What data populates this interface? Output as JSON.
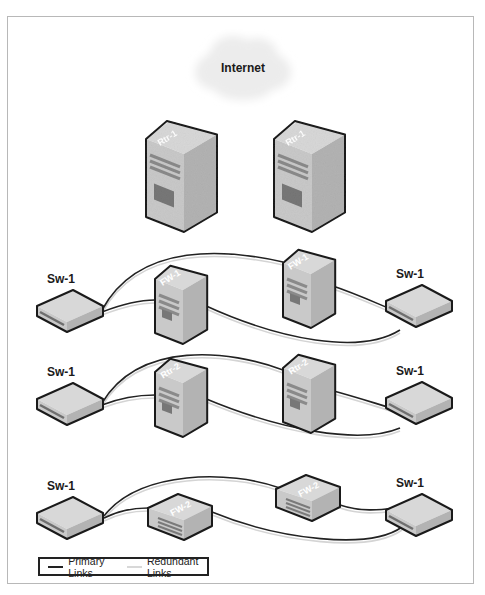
{
  "cloud": {
    "label": "Internet",
    "cx": 243,
    "cy": 68
  },
  "colors": {
    "primary": "#222222",
    "redundant": "#d4d4d4",
    "device_face": "#c9c9c9",
    "device_side": "#b3b3b3",
    "device_top": "#d8d8d8",
    "outline": "#1a1a1a",
    "cloud": "#ececec",
    "frame": "#b8b8b8"
  },
  "routers_top": [
    {
      "label": "Rtr-1",
      "x": 146,
      "y": 124
    },
    {
      "label": "Rtr-1",
      "x": 274,
      "y": 124
    }
  ],
  "rows": [
    {
      "name": "firewall-tier-1",
      "left_switch": {
        "label": "Sw-1",
        "x": 37,
        "y": 290
      },
      "right_switch": {
        "label": "Sw-1",
        "x": 386,
        "y": 285
      },
      "left_device": {
        "label": "FW-1",
        "kind": "tower-small",
        "x": 155,
        "y": 268
      },
      "right_device": {
        "label": "FW-1",
        "kind": "tower-small",
        "x": 283,
        "y": 252
      },
      "primary_links": [
        "M102,310 C140,240 230,250 283,262",
        "M102,312 C120,305 140,300 155,300",
        "M204,305 C280,340 360,355 400,330",
        "M330,285 C360,295 380,305 398,312"
      ]
    },
    {
      "name": "router-tier-2",
      "left_switch": {
        "label": "Sw-1",
        "x": 37,
        "y": 383
      },
      "right_switch": {
        "label": "Sw-1",
        "x": 386,
        "y": 382
      },
      "left_device": {
        "label": "Rtr-2",
        "kind": "tower-small",
        "x": 155,
        "y": 361
      },
      "right_device": {
        "label": "Rtr-2",
        "kind": "tower-small",
        "x": 283,
        "y": 357
      },
      "primary_links": [
        "M102,403 C140,340 230,350 283,370",
        "M102,405 C120,398 140,395 155,395",
        "M204,398 C280,430 360,445 400,428",
        "M330,390 C360,398 380,405 398,410"
      ]
    },
    {
      "name": "firewall-tier-2",
      "left_switch": {
        "label": "Sw-1",
        "x": 37,
        "y": 497
      },
      "right_switch": {
        "label": "Sw-1",
        "x": 386,
        "y": 494
      },
      "left_device": {
        "label": "FW-2",
        "kind": "box",
        "x": 148,
        "y": 494
      },
      "right_device": {
        "label": "FW-2",
        "kind": "box",
        "x": 276,
        "y": 475
      },
      "primary_links": [
        "M104,516 C140,470 230,470 280,488",
        "M104,518 C120,510 135,508 148,508",
        "M212,512 C280,540 370,550 402,527",
        "M340,505 C360,512 380,510 395,508"
      ]
    }
  ],
  "legend": {
    "primary_label": "Primary Links",
    "redundant_label": "Redundant Links"
  }
}
